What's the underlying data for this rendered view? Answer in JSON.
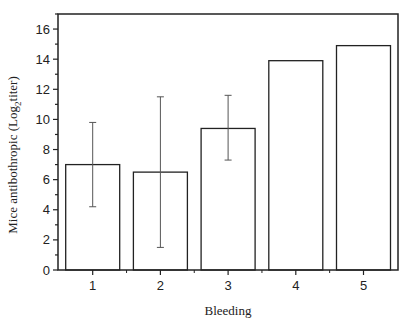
{
  "chart_data": {
    "type": "bar",
    "title": "",
    "xlabel": "Bleeding",
    "ylabel": "Mice antibothropic (Log",
    "ylabel_subscript": "2",
    "ylabel_suffix": "titer)",
    "categories": [
      "1",
      "2",
      "3",
      "4",
      "5"
    ],
    "values": [
      7.0,
      6.5,
      9.4,
      13.9,
      14.9
    ],
    "error_bars": [
      {
        "low": 4.2,
        "high": 9.8
      },
      {
        "low": 1.5,
        "high": 11.5
      },
      {
        "low": 7.3,
        "high": 11.6
      },
      null,
      null
    ],
    "ylim": [
      0,
      17
    ],
    "yticks": [
      0,
      2,
      4,
      6,
      8,
      10,
      12,
      14,
      16
    ],
    "y_minor_step": 1,
    "grid": false,
    "legend": null,
    "colors": {
      "bar_fill": "#ffffff",
      "bar_stroke": "#222222",
      "axis": "#222222",
      "error_bar": "#555555"
    }
  }
}
